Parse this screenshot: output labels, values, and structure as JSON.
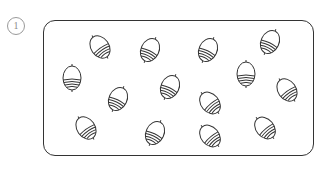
{
  "item_number": "1",
  "frame": {
    "stroke": "#333333"
  },
  "acorns": [
    {
      "x": 100,
      "y": 47,
      "rot": -35
    },
    {
      "x": 150,
      "y": 50,
      "rot": 25
    },
    {
      "x": 208,
      "y": 50,
      "rot": 25
    },
    {
      "x": 270,
      "y": 42,
      "rot": 25
    },
    {
      "x": 72,
      "y": 78,
      "rot": 0
    },
    {
      "x": 118,
      "y": 99,
      "rot": 25
    },
    {
      "x": 170,
      "y": 87,
      "rot": 25
    },
    {
      "x": 246,
      "y": 74,
      "rot": 0
    },
    {
      "x": 287,
      "y": 90,
      "rot": -35
    },
    {
      "x": 210,
      "y": 103,
      "rot": -40
    },
    {
      "x": 86,
      "y": 128,
      "rot": -35
    },
    {
      "x": 155,
      "y": 133,
      "rot": 25
    },
    {
      "x": 210,
      "y": 136,
      "rot": -40
    },
    {
      "x": 265,
      "y": 128,
      "rot": -40
    }
  ],
  "acorn_count": 14
}
